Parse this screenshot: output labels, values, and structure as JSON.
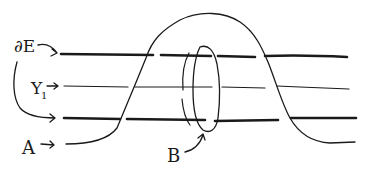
{
  "diagram": {
    "type": "hand-drawn topology sketch",
    "labels": {
      "boundary": "∂E",
      "y_strand": "Y",
      "y_subscript": "1",
      "arc_a": "A",
      "loop_b": "B"
    },
    "colors": {
      "ink": "#1a1a1a",
      "background": "#ffffff"
    },
    "strands": [
      {
        "name": "boundary-top",
        "weight": "bold"
      },
      {
        "name": "y1-middle",
        "weight": "thin"
      },
      {
        "name": "boundary-bottom",
        "weight": "bold"
      }
    ]
  }
}
